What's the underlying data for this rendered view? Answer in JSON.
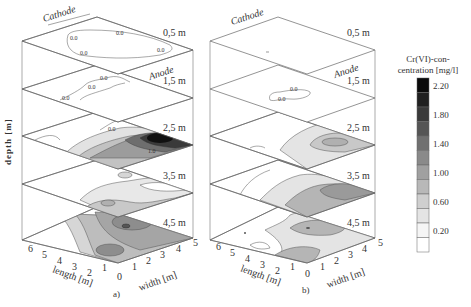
{
  "chart_data": [
    {
      "type": "heatmap",
      "panel": "a)",
      "title": "",
      "top_labels": {
        "cathode": "Cathode",
        "anode": "Anode"
      },
      "depth_levels": [
        "0,5 m",
        "1,5 m",
        "2,5 m",
        "3,5 m",
        "4,5 m"
      ],
      "xlabel": "width [m]",
      "ylabel": "length [m]",
      "zlabel": "depth [m]",
      "x_ticks": [
        "0",
        "1",
        "2",
        "3",
        "4",
        "5"
      ],
      "y_ticks": [
        "6",
        "5",
        "4",
        "3",
        "2",
        "1"
      ],
      "contour_annotations": {
        "0,5 m": [
          "0.0"
        ],
        "1,5 m": [
          "0.0"
        ],
        "2,5 m": [
          "0.0",
          "1.0"
        ],
        "4,5 m": [
          "1.0"
        ]
      },
      "max_concentration_region": "2,5 m level, near anode (width 4-5, length 0-2), > 2.20 mg/l"
    },
    {
      "type": "heatmap",
      "panel": "b)",
      "title": "",
      "top_labels": {
        "cathode": "Cathode",
        "anode": "Anode"
      },
      "depth_levels": [
        "0,5 m",
        "1,5 m",
        "2,5 m",
        "3,5 m",
        "4,5 m"
      ],
      "xlabel": "width [m]",
      "ylabel": "length [m]",
      "x_ticks": [
        "0",
        "1",
        "2",
        "3",
        "4",
        "5"
      ],
      "y_ticks": [
        "6",
        "5",
        "4",
        "3",
        "2",
        "1"
      ],
      "contour_annotations": {
        "1,5 m": [
          "0.0"
        ]
      }
    }
  ],
  "legend": {
    "title_line1": "Cr(VI)-con-",
    "title_line2": "centration [mg/l]",
    "levels": [
      {
        "label": "2.20",
        "color": "#0a0a0a"
      },
      {
        "label": "",
        "color": "#202020"
      },
      {
        "label": "1.80",
        "color": "#3a3a3a"
      },
      {
        "label": "",
        "color": "#555555"
      },
      {
        "label": "1.40",
        "color": "#707070"
      },
      {
        "label": "",
        "color": "#8a8a8a"
      },
      {
        "label": "1.00",
        "color": "#a0a0a0"
      },
      {
        "label": "",
        "color": "#b8b8b8"
      },
      {
        "label": "0.60",
        "color": "#cfcfcf"
      },
      {
        "label": "",
        "color": "#e4e4e4"
      },
      {
        "label": "0.20",
        "color": "#f5f5f5"
      },
      {
        "label": "",
        "color": "#ffffff"
      }
    ]
  },
  "labels": {
    "cathode": "Cathode",
    "anode": "Anode",
    "depth_axis": "depth [m]",
    "length_axis": "length [m]",
    "width_axis": "width [m]",
    "panel_a": "a)",
    "panel_b": "b)",
    "d0": "0,5 m",
    "d1": "1,5 m",
    "d2": "2,5 m",
    "d3": "3,5 m",
    "d4": "4,5 m",
    "c00": "0.0",
    "c10": "1.0",
    "yt6": "6",
    "yt5": "5",
    "yt4": "4",
    "yt3": "3",
    "yt2": "2",
    "yt1": "1",
    "xt0": "0",
    "xt1": "1",
    "xt2": "2",
    "xt3": "3",
    "xt4": "4",
    "xt5": "5"
  }
}
